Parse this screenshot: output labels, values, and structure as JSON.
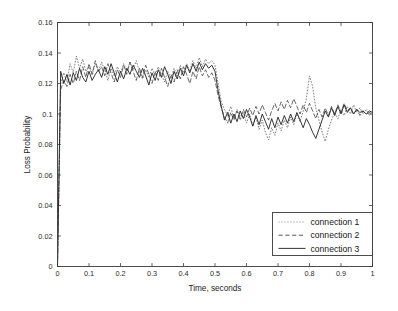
{
  "chart_data": {
    "type": "line",
    "title": "",
    "xlabel": "Time, seconds",
    "ylabel": "Loss Probability",
    "xlim": [
      0,
      1
    ],
    "ylim": [
      0,
      0.16
    ],
    "grid": false,
    "legend_position": "lower right",
    "xticks": [
      0,
      0.1,
      0.2,
      0.3,
      0.4,
      0.5,
      0.6,
      0.7,
      0.8,
      0.9,
      1
    ],
    "xticklabels": [
      "0",
      "0.1",
      "0.2",
      "0.3",
      "0.4",
      "0.5",
      "0.6",
      "0.7",
      "0.8",
      "0.9",
      "1"
    ],
    "yticks": [
      0,
      0.02,
      0.04,
      0.06,
      0.08,
      0.1,
      0.12,
      0.14,
      0.16
    ],
    "yticklabels": [
      "0",
      "0.02",
      "0.04",
      "0.06",
      "0.08",
      "0.1",
      "0.12",
      "0.14",
      "0.16"
    ],
    "x": [
      0.0,
      0.01,
      0.02,
      0.03,
      0.04,
      0.05,
      0.06,
      0.07,
      0.08,
      0.09,
      0.1,
      0.11,
      0.12,
      0.13,
      0.14,
      0.15,
      0.16,
      0.17,
      0.18,
      0.19,
      0.2,
      0.21,
      0.22,
      0.23,
      0.24,
      0.25,
      0.26,
      0.27,
      0.28,
      0.29,
      0.3,
      0.31,
      0.32,
      0.33,
      0.34,
      0.35,
      0.36,
      0.37,
      0.38,
      0.39,
      0.4,
      0.41,
      0.42,
      0.43,
      0.44,
      0.45,
      0.46,
      0.47,
      0.48,
      0.49,
      0.5,
      0.51,
      0.52,
      0.53,
      0.54,
      0.55,
      0.56,
      0.57,
      0.58,
      0.59,
      0.6,
      0.61,
      0.62,
      0.63,
      0.64,
      0.65,
      0.66,
      0.67,
      0.68,
      0.69,
      0.7,
      0.71,
      0.72,
      0.73,
      0.74,
      0.75,
      0.76,
      0.77,
      0.78,
      0.79,
      0.8,
      0.81,
      0.82,
      0.83,
      0.84,
      0.85,
      0.86,
      0.87,
      0.88,
      0.89,
      0.9,
      0.91,
      0.92,
      0.93,
      0.94,
      0.95,
      0.96,
      0.97,
      0.98,
      0.99,
      1.0
    ],
    "series": [
      {
        "name": "connection 1",
        "style": "dotted",
        "values": [
          0.0,
          0.12,
          0.127,
          0.121,
          0.133,
          0.127,
          0.138,
          0.13,
          0.136,
          0.128,
          0.131,
          0.126,
          0.133,
          0.128,
          0.134,
          0.129,
          0.122,
          0.13,
          0.125,
          0.131,
          0.127,
          0.133,
          0.128,
          0.134,
          0.129,
          0.135,
          0.128,
          0.123,
          0.129,
          0.124,
          0.13,
          0.125,
          0.131,
          0.126,
          0.121,
          0.128,
          0.123,
          0.13,
          0.125,
          0.132,
          0.127,
          0.133,
          0.128,
          0.135,
          0.13,
          0.137,
          0.131,
          0.136,
          0.133,
          0.135,
          0.132,
          0.12,
          0.108,
          0.103,
          0.099,
          0.105,
          0.097,
          0.103,
          0.096,
          0.101,
          0.094,
          0.1,
          0.092,
          0.098,
          0.09,
          0.096,
          0.088,
          0.083,
          0.091,
          0.086,
          0.094,
          0.089,
          0.096,
          0.091,
          0.098,
          0.093,
          0.1,
          0.095,
          0.102,
          0.11,
          0.125,
          0.118,
          0.104,
          0.096,
          0.088,
          0.082,
          0.09,
          0.096,
          0.101,
          0.097,
          0.103,
          0.099,
          0.105,
          0.1,
          0.106,
          0.101,
          0.104,
          0.1,
          0.103,
          0.099,
          0.101
        ]
      },
      {
        "name": "connection 2",
        "style": "dashed",
        "values": [
          0.0,
          0.116,
          0.122,
          0.118,
          0.126,
          0.12,
          0.128,
          0.122,
          0.131,
          0.124,
          0.133,
          0.126,
          0.135,
          0.128,
          0.131,
          0.125,
          0.133,
          0.127,
          0.121,
          0.129,
          0.124,
          0.132,
          0.126,
          0.134,
          0.128,
          0.122,
          0.13,
          0.124,
          0.132,
          0.126,
          0.12,
          0.128,
          0.122,
          0.13,
          0.124,
          0.118,
          0.126,
          0.121,
          0.129,
          0.123,
          0.131,
          0.126,
          0.12,
          0.128,
          0.123,
          0.131,
          0.125,
          0.129,
          0.124,
          0.127,
          0.122,
          0.112,
          0.104,
          0.098,
          0.094,
          0.101,
          0.096,
          0.102,
          0.097,
          0.103,
          0.098,
          0.104,
          0.099,
          0.105,
          0.1,
          0.106,
          0.101,
          0.096,
          0.102,
          0.107,
          0.102,
          0.108,
          0.103,
          0.109,
          0.104,
          0.11,
          0.105,
          0.1,
          0.106,
          0.101,
          0.107,
          0.102,
          0.097,
          0.103,
          0.098,
          0.104,
          0.099,
          0.105,
          0.1,
          0.106,
          0.101,
          0.107,
          0.102,
          0.104,
          0.1,
          0.103,
          0.099,
          0.102,
          0.1,
          0.101,
          0.1
        ]
      },
      {
        "name": "connection 3",
        "style": "solid",
        "values": [
          0.0,
          0.128,
          0.12,
          0.126,
          0.119,
          0.127,
          0.122,
          0.13,
          0.124,
          0.121,
          0.128,
          0.122,
          0.126,
          0.129,
          0.124,
          0.131,
          0.126,
          0.133,
          0.127,
          0.121,
          0.128,
          0.123,
          0.13,
          0.126,
          0.132,
          0.128,
          0.124,
          0.13,
          0.125,
          0.119,
          0.127,
          0.122,
          0.129,
          0.124,
          0.131,
          0.126,
          0.12,
          0.128,
          0.123,
          0.13,
          0.125,
          0.132,
          0.127,
          0.133,
          0.128,
          0.134,
          0.129,
          0.133,
          0.13,
          0.132,
          0.128,
          0.115,
          0.105,
          0.096,
          0.101,
          0.094,
          0.1,
          0.095,
          0.102,
          0.097,
          0.103,
          0.098,
          0.092,
          0.099,
          0.093,
          0.1,
          0.095,
          0.09,
          0.097,
          0.091,
          0.098,
          0.093,
          0.099,
          0.094,
          0.1,
          0.095,
          0.101,
          0.096,
          0.091,
          0.097,
          0.093,
          0.088,
          0.084,
          0.09,
          0.096,
          0.102,
          0.098,
          0.104,
          0.099,
          0.105,
          0.1,
          0.106,
          0.101,
          0.104,
          0.1,
          0.103,
          0.101,
          0.102,
          0.1,
          0.102,
          0.101
        ]
      }
    ]
  },
  "legend": {
    "entries": [
      {
        "label": "connection 1"
      },
      {
        "label": "connection 2"
      },
      {
        "label": "connection 3"
      }
    ]
  },
  "colors": {
    "axis": "#3a3a3a",
    "series_1": "#6d6d6d",
    "series_2": "#4f4f4f",
    "series_3": "#2a2a2a",
    "background": "#ffffff"
  }
}
